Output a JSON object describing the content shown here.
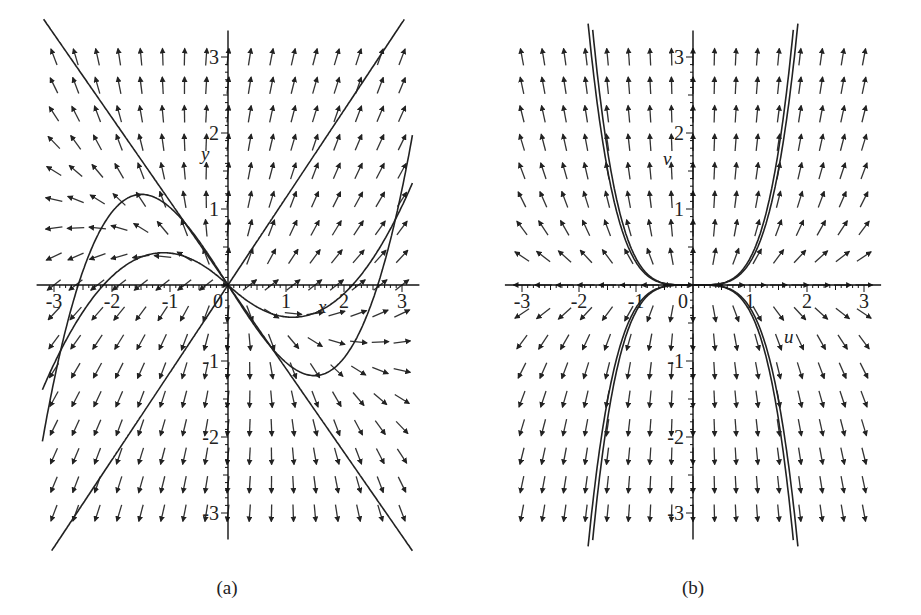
{
  "figure": {
    "panels": [
      {
        "id": "a",
        "caption": "(a)",
        "x_axis_label": "x",
        "y_axis_label": "y",
        "x_ticks": [
          "-3",
          "-2",
          "-1",
          "0",
          "1",
          "2",
          "3"
        ],
        "y_ticks": [
          "3",
          "2",
          "1",
          "-1",
          "-2",
          "-3"
        ],
        "origin_label": "0"
      },
      {
        "id": "b",
        "caption": "(b)",
        "x_axis_label": "u",
        "y_axis_label": "v",
        "x_ticks": [
          "-3",
          "-2",
          "-1",
          "0",
          "1",
          "2",
          "3"
        ],
        "y_ticks": [
          "3",
          "2",
          "1",
          "-1",
          "-2",
          "-3"
        ],
        "origin_label": "0"
      }
    ]
  },
  "chart_data": [
    {
      "type": "vector_field",
      "title": "(a)",
      "xlabel": "x",
      "ylabel": "y",
      "xlim": [
        -3,
        3
      ],
      "ylim": [
        -3,
        3
      ],
      "grid": false,
      "description": "Direction field with trajectories through the origin; two straight-line solutions (approximately y = -x and y = x) and curved trajectories tangent to the axes near the origin.",
      "trajectories": [
        "straight line descending through origin",
        "straight line ascending through origin",
        "curved S-shaped trajectories through origin"
      ]
    },
    {
      "type": "vector_field",
      "title": "(b)",
      "xlabel": "u",
      "ylabel": "v",
      "xlim": [
        -3,
        3
      ],
      "ylim": [
        -3,
        3
      ],
      "grid": false,
      "description": "Direction field with nearly vertical arrows away from the u-axis; trajectories leave the origin tangent to the u-axis and bend sharply upward/downward (cubic-like curves).",
      "trajectories": [
        "v ~ +c u^n (upper branches)",
        "v ~ -c u^n (lower branches)"
      ]
    }
  ]
}
